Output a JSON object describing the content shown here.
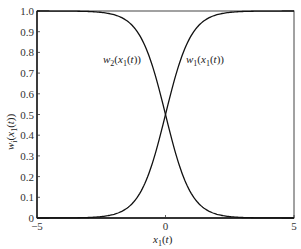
{
  "chart_data": {
    "type": "line",
    "title": "",
    "xlabel": "x1(t)",
    "ylabel": "w(x1(t))",
    "xlim": [
      -5,
      5
    ],
    "ylim": [
      0,
      1
    ],
    "grid": false,
    "legend": "none (inline curve labels)",
    "x_ticks": [
      "-5",
      "0",
      "5"
    ],
    "y_ticks": [
      "0",
      "0.1",
      "0.2",
      "0.3",
      "0.4",
      "0.5",
      "0.6",
      "0.7",
      "0.8",
      "0.9",
      "1.0"
    ],
    "x": [
      -5,
      -4,
      -3,
      -2.5,
      -2,
      -1.5,
      -1,
      -0.5,
      0,
      0.5,
      1,
      1.5,
      2,
      2.5,
      3,
      4,
      5
    ],
    "series": [
      {
        "name": "w1(x1(t))",
        "values": [
          0.0,
          0.0003,
          0.0025,
          0.0067,
          0.018,
          0.047,
          0.119,
          0.269,
          0.5,
          0.731,
          0.881,
          0.953,
          0.982,
          0.993,
          0.9975,
          0.9997,
          1.0
        ]
      },
      {
        "name": "w2(x1(t))",
        "values": [
          1.0,
          0.9997,
          0.9975,
          0.993,
          0.982,
          0.953,
          0.881,
          0.731,
          0.5,
          0.269,
          0.119,
          0.047,
          0.018,
          0.0067,
          0.0025,
          0.0003,
          0.0
        ]
      }
    ],
    "annotations": [
      {
        "text": "w2(x1(t))",
        "x": -1.85,
        "y": 0.81
      },
      {
        "text": "w1(x1(t))",
        "x": 0.75,
        "y": 0.81
      }
    ]
  },
  "labels": {
    "ylabel_main": "w",
    "ylabel_sub": "i",
    "ylabel_rest": "(x",
    "ylabel_sub2": "1",
    "ylabel_end": "(t))",
    "xlabel_main": "x",
    "xlabel_sub": "1",
    "xlabel_end": "(t)",
    "w2_main": "w",
    "w2_sub": "2",
    "w2_mid": "(x",
    "w2_sub2": "1",
    "w2_end": "(t))",
    "w1_main": "w",
    "w1_sub": "1",
    "w1_mid": "(x",
    "w1_sub2": "1",
    "w1_end": "(t))"
  }
}
